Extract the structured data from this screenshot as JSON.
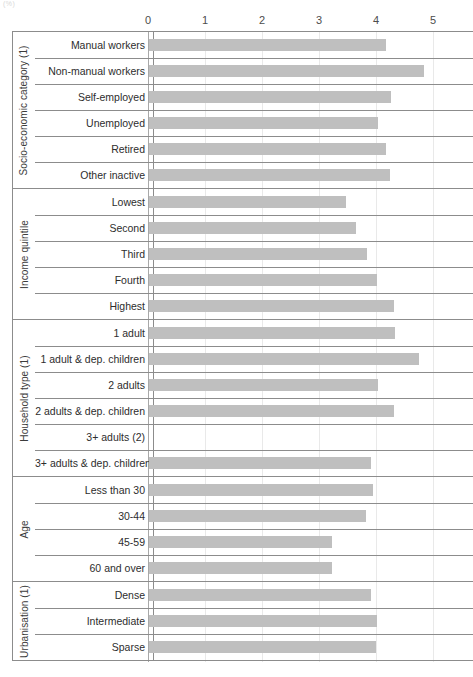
{
  "corner_note": "(%)",
  "chart_data": {
    "type": "bar",
    "orientation": "horizontal",
    "title": "",
    "subtitle": "",
    "xlabel": "",
    "ylabel": "",
    "xlim": [
      0,
      5
    ],
    "xticks": [
      "0",
      "1",
      "2",
      "3",
      "4",
      "5"
    ],
    "grid": true,
    "legend": "none",
    "bar_color": "#bfbfbf",
    "missing_note": "no bar shown for 3+ adults (2)",
    "groups": [
      {
        "label": "Socio-economic category (1)",
        "categories": [
          "Manual workers",
          "Non-manual workers",
          "Self-employed",
          "Unemployed",
          "Retired",
          "Other inactive"
        ],
        "values": [
          4.16,
          4.82,
          4.25,
          4.02,
          4.16,
          4.23
        ]
      },
      {
        "label": "Income quintile",
        "categories": [
          "Lowest",
          "Second",
          "Third",
          "Fourth",
          "Highest"
        ],
        "values": [
          3.46,
          3.63,
          3.82,
          4.0,
          4.3
        ]
      },
      {
        "label": "Household type (1)",
        "categories": [
          "1 adult",
          "1 adult & dep. children",
          "2 adults",
          "2 adults & dep. children",
          "3+ adults (2)",
          "3+ adults & dep. children"
        ],
        "values": [
          4.32,
          4.74,
          4.02,
          4.3,
          null,
          3.89
        ]
      },
      {
        "label": "Age",
        "categories": [
          "Less than 30",
          "30-44",
          "45-59",
          "60 and over"
        ],
        "values": [
          3.93,
          3.81,
          3.21,
          3.21
        ]
      },
      {
        "label": "Urbanisation (1)",
        "categories": [
          "Dense",
          "Intermediate",
          "Sparse"
        ],
        "values": [
          3.89,
          4.0,
          3.98
        ]
      }
    ]
  }
}
